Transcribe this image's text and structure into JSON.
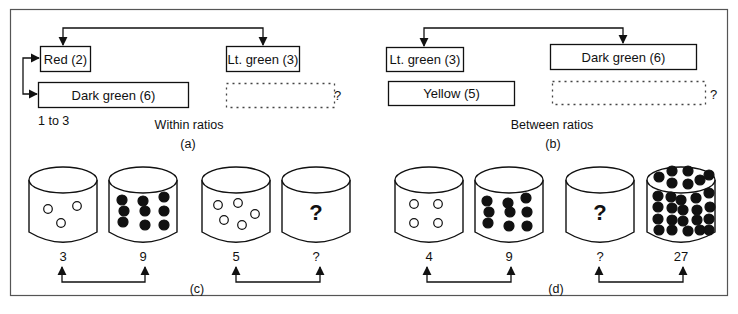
{
  "colors": {
    "ink": "#111111",
    "frame": "#555555",
    "dash": "#444444",
    "background": "#ffffff"
  },
  "panel_a": {
    "title": "Within ratios",
    "label": "(a)",
    "ratio_note": "1 to 3",
    "boxes": [
      {
        "id": "red",
        "text": "Red (2)",
        "x": 40,
        "y": 46,
        "w": 50,
        "h": 25,
        "dashed": false
      },
      {
        "id": "dark-green",
        "text": "Dark green (6)",
        "x": 38,
        "y": 82,
        "w": 150,
        "h": 25,
        "dashed": false
      },
      {
        "id": "lt-green",
        "text": "Lt. green (3)",
        "x": 226,
        "y": 46,
        "w": 73,
        "h": 25,
        "dashed": false
      },
      {
        "id": "unknown",
        "text": "",
        "x": 226,
        "y": 83,
        "w": 108,
        "h": 24,
        "dashed": true
      }
    ],
    "unknown_mark": "?"
  },
  "panel_b": {
    "title": "Between ratios",
    "label": "(b)",
    "boxes": [
      {
        "id": "lt-green",
        "text": "Lt. green (3)",
        "x": 386,
        "y": 47,
        "w": 77,
        "h": 24,
        "dashed": false
      },
      {
        "id": "yellow",
        "text": "Yellow (5)",
        "x": 388,
        "y": 81,
        "w": 126,
        "h": 24,
        "dashed": false
      },
      {
        "id": "dark-green",
        "text": "Dark green (6)",
        "x": 550,
        "y": 44,
        "w": 146,
        "h": 25,
        "dashed": false
      },
      {
        "id": "unknown",
        "text": "",
        "x": 552,
        "y": 81,
        "w": 153,
        "h": 23,
        "dashed": true
      }
    ],
    "unknown_mark": "?"
  },
  "panel_c": {
    "label": "(c)",
    "cylinders": [
      {
        "x": 29,
        "count_label": "3",
        "fill": "open",
        "dots": [
          [
            48,
            209
          ],
          [
            77,
            206
          ],
          [
            61,
            223
          ]
        ]
      },
      {
        "x": 109,
        "count_label": "9",
        "fill": "solid",
        "dots": [
          [
            122,
            200
          ],
          [
            143,
            201
          ],
          [
            164,
            197
          ],
          [
            124,
            211
          ],
          [
            145,
            211
          ],
          [
            164,
            211
          ],
          [
            123,
            222
          ],
          [
            145,
            225
          ],
          [
            164,
            225
          ]
        ]
      },
      {
        "x": 202,
        "count_label": "5",
        "fill": "open",
        "dots": [
          [
            218,
            205
          ],
          [
            238,
            203
          ],
          [
            224,
            220
          ],
          [
            242,
            225
          ],
          [
            255,
            214
          ]
        ]
      },
      {
        "x": 282,
        "count_label": "?",
        "fill": "none",
        "question": "?",
        "dots": []
      }
    ]
  },
  "panel_d": {
    "label": "(d)",
    "cylinders": [
      {
        "x": 395,
        "count_label": "4",
        "fill": "open",
        "dots": [
          [
            414,
            204
          ],
          [
            438,
            204
          ],
          [
            414,
            223
          ],
          [
            438,
            223
          ]
        ]
      },
      {
        "x": 475,
        "count_label": "9",
        "fill": "solid",
        "dots": [
          [
            487,
            201
          ],
          [
            508,
            203
          ],
          [
            526,
            198
          ],
          [
            489,
            212
          ],
          [
            510,
            212
          ],
          [
            527,
            212
          ],
          [
            488,
            223
          ],
          [
            509,
            226
          ],
          [
            527,
            226
          ]
        ]
      },
      {
        "x": 566,
        "count_label": "?",
        "fill": "none",
        "question": "?",
        "dots": []
      },
      {
        "x": 647,
        "count_label": "27",
        "fill": "solid",
        "dots": [
          [
            659,
            177
          ],
          [
            672,
            171
          ],
          [
            688,
            171
          ],
          [
            672,
            183
          ],
          [
            688,
            184
          ],
          [
            700,
            180
          ],
          [
            709,
            175
          ],
          [
            658,
            196
          ],
          [
            671,
            197
          ],
          [
            681,
            200
          ],
          [
            696,
            198
          ],
          [
            709,
            193
          ],
          [
            658,
            207
          ],
          [
            672,
            208
          ],
          [
            683,
            210
          ],
          [
            697,
            210
          ],
          [
            710,
            207
          ],
          [
            658,
            219
          ],
          [
            672,
            220
          ],
          [
            683,
            221
          ],
          [
            697,
            220
          ],
          [
            709,
            219
          ],
          [
            659,
            230
          ],
          [
            672,
            230
          ],
          [
            688,
            231
          ],
          [
            700,
            230
          ],
          [
            709,
            230
          ]
        ]
      }
    ]
  },
  "pairs": [
    {
      "panel": "c",
      "from_x": 62,
      "to_x": 145,
      "from_label": "3",
      "to_label": "9"
    },
    {
      "panel": "c",
      "from_x": 236,
      "to_x": 320,
      "from_label": "5",
      "to_label": "?"
    },
    {
      "panel": "d",
      "from_x": 427,
      "to_x": 511,
      "from_label": "4",
      "to_label": "9"
    },
    {
      "panel": "d",
      "from_x": 599,
      "to_x": 683,
      "from_label": "?",
      "to_label": "27"
    }
  ]
}
